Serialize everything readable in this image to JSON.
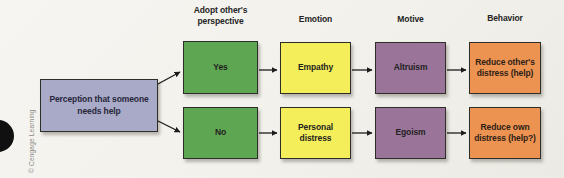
{
  "diagram": {
    "title_implicit": "Helping decision flow",
    "headers": [
      "Adopt other's perspective",
      "Emotion",
      "Motive",
      "Behavior"
    ],
    "boxes": {
      "perception": {
        "text": "Perception that someone needs help",
        "color": "#a9aac8"
      },
      "yes": {
        "text": "Yes",
        "color": "#5fa653"
      },
      "no": {
        "text": "No",
        "color": "#5fa653"
      },
      "empathy": {
        "text": "Empathy",
        "color": "#f3ee59"
      },
      "personal_distress": {
        "text": "Personal distress",
        "color": "#f3ee59"
      },
      "altruism": {
        "text": "Altruism",
        "color": "#9a7599"
      },
      "egoism": {
        "text": "Egoism",
        "color": "#9a7599"
      },
      "reduce_others": {
        "text": "Reduce other's distress (help)",
        "color": "#ec9351"
      },
      "reduce_own": {
        "text": "Reduce own distress (help?)",
        "color": "#ec9351"
      }
    },
    "flows": [
      "perception -> yes",
      "perception -> no",
      "yes -> empathy",
      "empathy -> altruism",
      "altruism -> reduce_others",
      "no -> personal_distress",
      "personal_distress -> egoism",
      "egoism -> reduce_own"
    ]
  },
  "credit": "© Cengage Learning",
  "colors": {
    "background": "#f2f1ec",
    "box_border": "#2e2e28",
    "arrow": "#1c1c1c",
    "header_text": "#242424",
    "credit_text": "#8b8b85"
  }
}
